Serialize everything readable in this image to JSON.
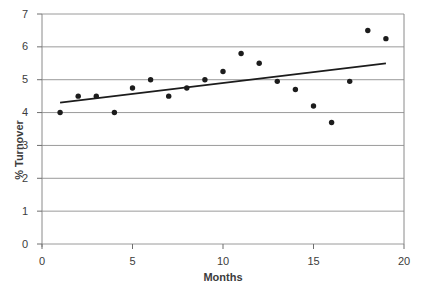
{
  "chart": {
    "background": "#ffffff",
    "grid_color": "#9a9a9a",
    "axis_color": "#8a8a8a",
    "tick_color": "#6e6e6e",
    "point_color": "#1c1c1c",
    "trend_color": "#1c1c1c",
    "label_color": "#3c3c3c"
  },
  "chart_data": {
    "type": "scatter",
    "title": "",
    "xlabel": "Months",
    "ylabel": "% Turnover",
    "xlim": [
      0,
      20
    ],
    "ylim": [
      0,
      7
    ],
    "x_ticks": [
      0,
      5,
      10,
      15,
      20
    ],
    "y_ticks": [
      0,
      1,
      2,
      3,
      4,
      5,
      6,
      7
    ],
    "grid": "horizontal-only",
    "legend": "none",
    "series": [
      {
        "name": "monthly-turnover-points",
        "type": "scatter",
        "x": [
          1,
          2,
          3,
          4,
          5,
          6,
          7,
          8,
          9,
          10,
          11,
          12,
          13,
          14,
          15,
          16,
          17,
          18,
          19
        ],
        "y": [
          4.0,
          4.5,
          4.5,
          4.0,
          4.75,
          5.0,
          4.5,
          4.75,
          5.0,
          5.25,
          5.8,
          5.5,
          4.95,
          4.7,
          4.2,
          3.7,
          4.95,
          6.5,
          6.25
        ]
      },
      {
        "name": "trend-line",
        "type": "line",
        "x": [
          1,
          19
        ],
        "y": [
          4.3,
          5.5
        ]
      }
    ]
  }
}
